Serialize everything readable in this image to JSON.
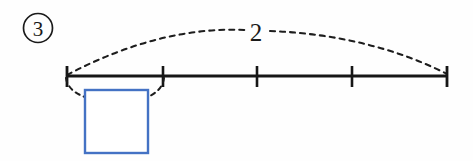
{
  "figure": {
    "problem_number": "3",
    "arc_label": "2",
    "answer_box_value": "",
    "background_color": "#fefefe",
    "line_color": "#161616",
    "dash_color": "#1d1d1d",
    "box_border_color": "#4472c4"
  },
  "number_line": {
    "tick_count": 5,
    "tick_positions_px": [
      67,
      163,
      257,
      352,
      447
    ],
    "baseline_y_px": 76,
    "tick_half_height_px": 10,
    "line_start_px": 67,
    "line_end_px": 447
  },
  "annotations": {
    "upper_arc": {
      "label": "2",
      "from_tick_index": 0,
      "to_tick_index": 4,
      "style": "dashed-arc"
    },
    "lower_arc": {
      "label": "",
      "from_tick_index": 0,
      "to_tick_index": 1,
      "style": "dashed-arc-to-box"
    }
  },
  "answer_box": {
    "label": "",
    "x_px": 85,
    "y_px": 90,
    "width_px": 63,
    "height_px": 63
  }
}
